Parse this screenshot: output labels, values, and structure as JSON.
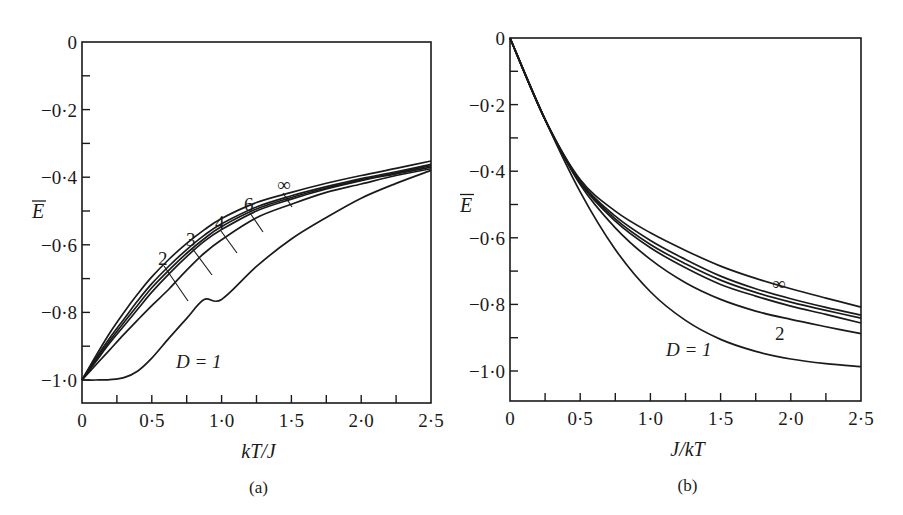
{
  "chart_data": [
    {
      "panel": "(a)",
      "type": "line",
      "title": "",
      "xlabel": "kT/J",
      "ylabel": "Ē",
      "xlim": [
        0,
        2.5
      ],
      "ylim": [
        -1.07,
        0
      ],
      "grid": false,
      "xticks": [
        "0",
        "0·5",
        "1·0",
        "1·5",
        "2·0",
        "2·5"
      ],
      "yticks": [
        "0",
        "−0·2",
        "−0·4",
        "−0·6",
        "−0·8",
        "−1·0"
      ],
      "x": [
        0,
        0.1,
        0.2,
        0.3,
        0.4,
        0.5,
        0.625,
        0.75,
        0.875,
        1.0,
        1.25,
        1.5,
        1.75,
        2.0,
        2.25,
        2.5
      ],
      "series": [
        {
          "name": "D=1",
          "values": [
            -1.0,
            -1.0,
            -0.9987,
            -0.993,
            -0.9732,
            -0.9354,
            -0.8755,
            -0.8175,
            -0.762,
            -0.7616,
            -0.664,
            -0.5828,
            -0.5193,
            -0.4621,
            -0.4183,
            -0.3799
          ]
        },
        {
          "name": "2",
          "values": [
            -1.0,
            -0.955,
            -0.91,
            -0.865,
            -0.822,
            -0.78,
            -0.73,
            -0.675,
            -0.625,
            -0.585,
            -0.52,
            -0.48,
            -0.445,
            -0.42,
            -0.395,
            -0.375
          ]
        },
        {
          "name": "3",
          "values": [
            -1.0,
            -0.945,
            -0.89,
            -0.84,
            -0.79,
            -0.74,
            -0.685,
            -0.635,
            -0.59,
            -0.555,
            -0.5,
            -0.465,
            -0.435,
            -0.41,
            -0.39,
            -0.37
          ]
        },
        {
          "name": "4",
          "values": [
            -1.0,
            -0.94,
            -0.883,
            -0.83,
            -0.778,
            -0.727,
            -0.674,
            -0.625,
            -0.582,
            -0.546,
            -0.494,
            -0.46,
            -0.432,
            -0.408,
            -0.387,
            -0.366
          ]
        },
        {
          "name": "6",
          "values": [
            -1.0,
            -0.935,
            -0.875,
            -0.82,
            -0.765,
            -0.715,
            -0.662,
            -0.614,
            -0.572,
            -0.538,
            -0.488,
            -0.455,
            -0.428,
            -0.404,
            -0.384,
            -0.362
          ]
        },
        {
          "name": "∞",
          "values": [
            -1.0,
            -0.928,
            -0.86,
            -0.8,
            -0.745,
            -0.695,
            -0.642,
            -0.596,
            -0.556,
            -0.522,
            -0.475,
            -0.445,
            -0.418,
            -0.395,
            -0.374,
            -0.352
          ]
        }
      ],
      "annotations": [
        "D=1",
        "2",
        "3",
        "4",
        "6",
        "∞"
      ]
    },
    {
      "panel": "(b)",
      "type": "line",
      "title": "",
      "xlabel": "J/kT",
      "ylabel": "Ē",
      "xlim": [
        0,
        2.5
      ],
      "ylim": [
        -1.09,
        0
      ],
      "grid": false,
      "xticks": [
        "0",
        "0·5",
        "1·0",
        "1·5",
        "2·0",
        "2·5"
      ],
      "yticks": [
        "0",
        "−0·2",
        "−0·4",
        "−0·6",
        "−0·8",
        "−1·0"
      ],
      "x": [
        0,
        0.25,
        0.5,
        0.75,
        1.0,
        1.25,
        1.5,
        1.75,
        2.0,
        2.25,
        2.5
      ],
      "series": [
        {
          "name": "D=1",
          "values": [
            0,
            -0.245,
            -0.462,
            -0.635,
            -0.762,
            -0.848,
            -0.905,
            -0.941,
            -0.964,
            -0.978,
            -0.987
          ]
        },
        {
          "name": "2",
          "values": [
            0,
            -0.245,
            -0.44,
            -0.57,
            -0.665,
            -0.735,
            -0.785,
            -0.82,
            -0.845,
            -0.867,
            -0.888
          ]
        },
        {
          "name": "3",
          "values": [
            0,
            -0.245,
            -0.435,
            -0.55,
            -0.63,
            -0.69,
            -0.74,
            -0.775,
            -0.805,
            -0.83,
            -0.856
          ]
        },
        {
          "name": "4",
          "values": [
            0,
            -0.245,
            -0.432,
            -0.543,
            -0.62,
            -0.678,
            -0.727,
            -0.764,
            -0.793,
            -0.818,
            -0.841
          ]
        },
        {
          "name": "6",
          "values": [
            0,
            -0.245,
            -0.43,
            -0.535,
            -0.608,
            -0.665,
            -0.715,
            -0.753,
            -0.783,
            -0.809,
            -0.832
          ]
        },
        {
          "name": "∞",
          "values": [
            0,
            -0.245,
            -0.425,
            -0.52,
            -0.585,
            -0.638,
            -0.685,
            -0.722,
            -0.753,
            -0.781,
            -0.808
          ]
        }
      ],
      "annotations": [
        "D=1",
        "2",
        "∞"
      ]
    }
  ],
  "panels": [
    {
      "caption": "(a)",
      "xlabel": "kT/J",
      "ylabel": "E",
      "frame": {
        "x0": 82,
        "x1": 431,
        "ytop": 42,
        "ybot": 403,
        "yzero": 42,
        "yminus1": 380
      },
      "labels": [
        {
          "text": "∞",
          "x": 277,
          "y": 191,
          "lx1": 283,
          "ly1": 193,
          "lx2": 292,
          "ly2": 207
        },
        {
          "text": "6",
          "x": 244,
          "y": 211,
          "lx1": 250,
          "ly1": 213,
          "lx2": 263,
          "ly2": 232
        },
        {
          "text": "4",
          "x": 215,
          "y": 229,
          "lx1": 221,
          "ly1": 231,
          "lx2": 237,
          "ly2": 253
        },
        {
          "text": "3",
          "x": 186,
          "y": 246,
          "lx1": 192,
          "ly1": 248,
          "lx2": 212,
          "ly2": 275
        },
        {
          "text": "2",
          "x": 158,
          "y": 265,
          "lx1": 164,
          "ly1": 266,
          "lx2": 188,
          "ly2": 301
        },
        {
          "text": "D = 1",
          "x": 176,
          "y": 368
        }
      ]
    },
    {
      "caption": "(b)",
      "xlabel": "J/kT",
      "ylabel": "E",
      "frame": {
        "x0": 510,
        "x1": 861,
        "ytop": 38,
        "ybot": 401,
        "yzero": 38,
        "yminus1": 371
      },
      "labels": [
        {
          "text": "∞",
          "x": 772,
          "y": 290
        },
        {
          "text": "2",
          "x": 775,
          "y": 340
        },
        {
          "text": "D = 1",
          "x": 666,
          "y": 356
        }
      ]
    }
  ]
}
